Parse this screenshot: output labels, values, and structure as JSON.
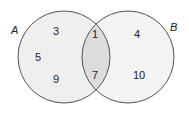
{
  "diagram": {
    "type": "venn",
    "sets": [
      {
        "label": "A",
        "only": [
          "3",
          "5",
          "9"
        ]
      },
      {
        "label": "B",
        "only": [
          "4",
          "10"
        ]
      }
    ],
    "intersection": [
      "1",
      "7"
    ],
    "colors": {
      "circle_fill": "#efefef",
      "intersection_fill": "#dcdcdc",
      "stroke": "#555555"
    }
  }
}
